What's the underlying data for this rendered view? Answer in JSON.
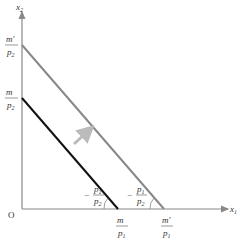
{
  "diagram": {
    "type": "budget-line-shift",
    "axes": {
      "x_label": "x",
      "x_sub": "1",
      "y_label": "x",
      "y_sub": "2",
      "origin": "O"
    },
    "lines": [
      {
        "name": "original-budget-line",
        "color": "#111111",
        "y_intercept": {
          "num": "m",
          "den": "p",
          "den_sub": "2"
        },
        "x_intercept": {
          "num": "m",
          "den": "p",
          "den_sub": "1"
        },
        "slope": {
          "sign": "−",
          "num": "p",
          "num_sub": "1",
          "den": "p",
          "den_sub": "2"
        }
      },
      {
        "name": "new-budget-line",
        "color": "#888888",
        "y_intercept": {
          "num": "m′",
          "den": "p",
          "den_sub": "2"
        },
        "x_intercept": {
          "num": "m′",
          "den": "p",
          "den_sub": "1"
        },
        "slope": {
          "sign": "−",
          "num": "p",
          "num_sub": "1",
          "den": "p",
          "den_sub": "2"
        }
      }
    ],
    "shift_arrow": {
      "color": "#bbbbbb",
      "direction": "outward"
    },
    "axis_color": "#888888"
  }
}
